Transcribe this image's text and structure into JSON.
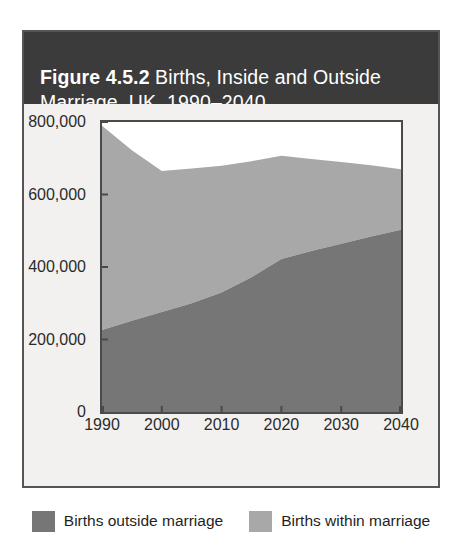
{
  "figure": {
    "title_number": "Figure 4.5.2",
    "title_rest": " Births, Inside and Outside Marriage, UK, 1990–2040",
    "title_full": "Figure 4.5.2 Births, Inside and Outside Marriage, UK, 1990–2040"
  },
  "colors": {
    "title_bar_bg": "#3b3b3b",
    "title_text": "#ffffff",
    "card_bg": "#f2f1ef",
    "plot_bg": "#ffffff",
    "axis": "#4a4a4a",
    "outside_marriage": "#767676",
    "within_marriage": "#a8a8a8",
    "gridline": "#d9d9d9",
    "border": "#555555"
  },
  "chart_data": {
    "type": "area",
    "stacked": true,
    "title": "Figure 4.5.2 Births, Inside and Outside Marriage, UK, 1990–2040",
    "xlabel": "",
    "ylabel": "",
    "x": [
      1990,
      1995,
      2000,
      2005,
      2010,
      2015,
      2020,
      2025,
      2030,
      2035,
      2040
    ],
    "xlim": [
      1990,
      2040
    ],
    "ylim": [
      0,
      800000
    ],
    "xticks": [
      1990,
      2000,
      2010,
      2020,
      2030,
      2040
    ],
    "xtick_labels": [
      "1990",
      "2000",
      "2010",
      "2020",
      "2030",
      "2040"
    ],
    "yticks": [
      0,
      200000,
      400000,
      600000,
      800000
    ],
    "ytick_labels": [
      "0",
      "200,000",
      "400,000",
      "600,000",
      "800,000"
    ],
    "grid": true,
    "gridlines_y": [
      400000
    ],
    "legend_position": "bottom",
    "series": [
      {
        "name": "Births outside marriage",
        "color": "#767676",
        "values": [
          226000,
          252000,
          276000,
          300000,
          330000,
          372000,
          422000,
          444000,
          464000,
          484000,
          503000
        ]
      },
      {
        "name": "Births within marriage",
        "color": "#a8a8a8",
        "values": [
          564000,
          470000,
          389000,
          372000,
          349000,
          320000,
          285000,
          254000,
          226000,
          197000,
          167000
        ]
      }
    ],
    "totals": [
      790000,
      722000,
      665000,
      672000,
      679000,
      692000,
      707000,
      698000,
      690000,
      681000,
      670000
    ]
  },
  "legend": {
    "items": [
      {
        "label": "Births outside marriage",
        "color": "#767676"
      },
      {
        "label": "Births within marriage",
        "color": "#a8a8a8"
      }
    ]
  }
}
